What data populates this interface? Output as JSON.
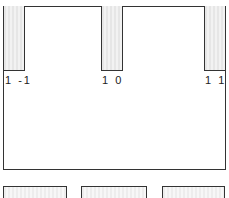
{
  "diagram": {
    "columns": [
      {
        "label": "1 -1"
      },
      {
        "label": "1 0"
      },
      {
        "label": "1 1"
      }
    ],
    "bottom_strip": {
      "segments": 3
    },
    "colors": {
      "line": "#333333",
      "fill": "#eeeeee",
      "background": "#ffffff"
    }
  }
}
